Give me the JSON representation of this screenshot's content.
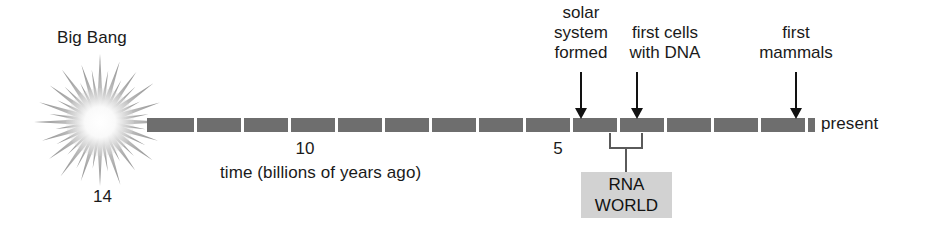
{
  "figure": {
    "background": "#ffffff",
    "bar_color": "#6e6e6e",
    "tick_color": "#ffffff",
    "arrow_color": "#121212",
    "bracket_color": "#5a5a5a",
    "rna_box_color": "#d2d2d2",
    "burst_color": "#9a9a9a"
  },
  "big_bang": {
    "label": "Big Bang",
    "age": "14",
    "icon": "starburst-icon"
  },
  "axis": {
    "label": "time (billions of years ago)",
    "present_label": "present",
    "tick_labels": [
      {
        "value": "10",
        "x": 305
      },
      {
        "value": "5",
        "x": 558
      }
    ],
    "bar": {
      "x": 147,
      "y": 118,
      "width": 668,
      "height": 14,
      "segment_ticks": [
        47,
        94,
        141,
        188,
        235,
        282,
        329,
        376,
        423,
        470,
        517,
        564,
        611,
        658
      ]
    }
  },
  "events": [
    {
      "id": "solar-system-formed",
      "lines": [
        "solar",
        "system",
        "formed"
      ],
      "arrow_x": 581,
      "arrow_top": 72,
      "arrow_height": 38
    },
    {
      "id": "first-cells-with-dna",
      "lines": [
        "first cells",
        "with DNA"
      ],
      "arrow_x": 637,
      "arrow_top": 72,
      "arrow_height": 38
    },
    {
      "id": "first-mammals",
      "lines": [
        "first",
        "mammals"
      ],
      "arrow_x": 796,
      "arrow_top": 72,
      "arrow_height": 38
    }
  ],
  "rna_world": {
    "lines": [
      "RNA",
      "WORLD"
    ],
    "bracket_left_x": 609,
    "bracket_right_x": 643,
    "bracket_y": 133
  }
}
